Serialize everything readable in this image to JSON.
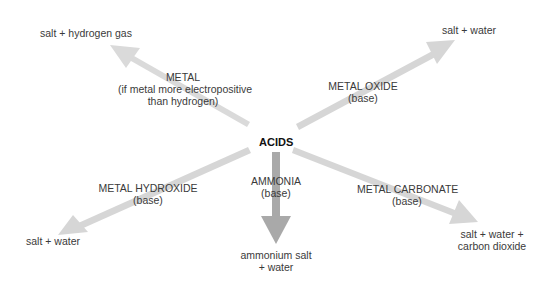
{
  "center": {
    "label": "ACIDS"
  },
  "colors": {
    "arrow_light": "#d8d8d8",
    "arrow_dark": "#a8a8a8",
    "text": "#3a3a3a"
  },
  "reactions": [
    {
      "id": "metal",
      "reagent": [
        "METAL",
        "(if metal more electropositive",
        "than hydrogen)"
      ],
      "product": [
        "salt + hydrogen gas"
      ]
    },
    {
      "id": "metal-oxide",
      "reagent": [
        "METAL OXIDE",
        "(base)"
      ],
      "product": [
        "salt + water"
      ]
    },
    {
      "id": "metal-hydroxide",
      "reagent": [
        "METAL HYDROXIDE",
        "(base)"
      ],
      "product": [
        "salt + water"
      ]
    },
    {
      "id": "ammonia",
      "reagent": [
        "AMMONIA",
        "(base)"
      ],
      "product": [
        "ammonium salt",
        "+ water"
      ]
    },
    {
      "id": "metal-carbonate",
      "reagent": [
        "METAL CARBONATE",
        "(base)"
      ],
      "product": [
        "salt + water +",
        "carbon dioxide"
      ]
    }
  ]
}
